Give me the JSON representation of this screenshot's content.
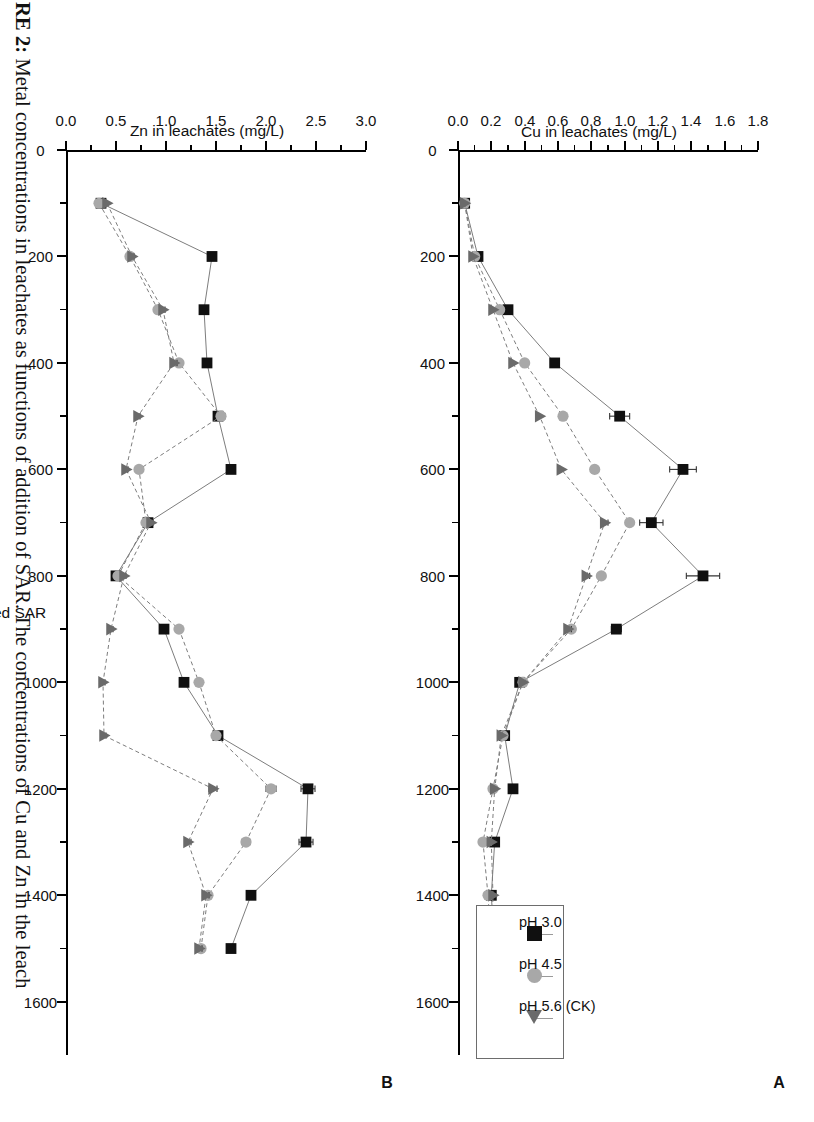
{
  "caption": {
    "prefix": "RE 2:",
    "text": " Metal concentrations in leachates as functions of addition of SAR. The concentrations of Cu and Zn in the leach"
  },
  "figure": {
    "xlabel": "mm of added SAR",
    "panel_a_letter": "A",
    "panel_b_letter": "B"
  },
  "legend": {
    "items": [
      {
        "label": "pH 3.0",
        "marker": "square-marker",
        "color": "#101010"
      },
      {
        "label": "pH 4.5",
        "marker": "circle-marker",
        "color": "#a8a8a8"
      },
      {
        "label": "pH 5.6 (CK)",
        "marker": "triangle-marker",
        "color": "#6a6a6a"
      }
    ]
  },
  "chart_data": [
    {
      "type": "line",
      "panel": "A",
      "title": "",
      "ylabel": "Cu in leachates (mg/L)",
      "xlabel": "mm of added SAR",
      "xlim": [
        0,
        1700
      ],
      "ylim": [
        0.0,
        1.8
      ],
      "xticks": [
        0,
        200,
        400,
        600,
        800,
        1000,
        1200,
        1400,
        1600
      ],
      "yticks": [
        "0.0",
        "0.2",
        "0.4",
        "0.6",
        "0.8",
        "1.0",
        "1.2",
        "1.4",
        "1.6",
        "1.8"
      ],
      "ytick_values": [
        0.0,
        0.2,
        0.4,
        0.6,
        0.8,
        1.0,
        1.2,
        1.4,
        1.6,
        1.8
      ],
      "grid": false,
      "legend_position": "bottom-right",
      "x": [
        100,
        200,
        300,
        400,
        500,
        600,
        700,
        800,
        900,
        1000,
        1100,
        1200,
        1300,
        1400,
        1500
      ],
      "series": [
        {
          "name": "pH 3.0",
          "marker": "square-marker",
          "color": "#101010",
          "values": [
            0.04,
            0.12,
            0.3,
            0.58,
            0.97,
            1.35,
            1.16,
            1.47,
            0.95,
            0.37,
            0.28,
            0.33,
            0.22,
            0.2,
            0.22
          ],
          "errors": [
            0.0,
            0.01,
            0.01,
            0.02,
            0.06,
            0.08,
            0.07,
            0.1,
            0.03,
            0.02,
            0.02,
            0.02,
            0.02,
            0.01,
            0.01
          ]
        },
        {
          "name": "pH 4.5",
          "marker": "circle-marker",
          "color": "#a8a8a8",
          "values": [
            0.04,
            0.1,
            0.25,
            0.4,
            0.63,
            0.82,
            1.03,
            0.86,
            0.68,
            0.39,
            0.27,
            0.21,
            0.15,
            0.18,
            0.2
          ],
          "errors": [
            0.0,
            0.01,
            0.01,
            0.01,
            0.02,
            0.02,
            0.02,
            0.02,
            0.02,
            0.02,
            0.01,
            0.01,
            0.01,
            0.01,
            0.01
          ]
        },
        {
          "name": "pH 5.6 (CK)",
          "marker": "triangle-marker",
          "color": "#6a6a6a",
          "values": [
            0.04,
            0.09,
            0.21,
            0.33,
            0.49,
            0.62,
            0.88,
            0.77,
            0.66,
            0.39,
            0.26,
            0.22,
            0.2,
            0.21,
            0.2
          ],
          "errors": [
            0.0,
            0.01,
            0.01,
            0.01,
            0.01,
            0.01,
            0.02,
            0.02,
            0.02,
            0.01,
            0.01,
            0.01,
            0.01,
            0.01,
            0.01
          ]
        }
      ]
    },
    {
      "type": "line",
      "panel": "B",
      "title": "",
      "ylabel": "Zn in leachates (mg/L)",
      "xlabel": "mm of added SAR",
      "xlim": [
        0,
        1700
      ],
      "ylim": [
        0.0,
        3.0
      ],
      "xticks": [
        0,
        200,
        400,
        600,
        800,
        1000,
        1200,
        1400,
        1600
      ],
      "yticks": [
        "0.0",
        "0.5",
        "1.0",
        "1.5",
        "2.0",
        "2.5",
        "3.0"
      ],
      "ytick_values": [
        0.0,
        0.5,
        1.0,
        1.5,
        2.0,
        2.5,
        3.0
      ],
      "grid": false,
      "legend_position": "none",
      "x": [
        100,
        200,
        300,
        400,
        500,
        600,
        700,
        800,
        900,
        1000,
        1100,
        1200,
        1300,
        1400,
        1500
      ],
      "series": [
        {
          "name": "pH 3.0",
          "marker": "square-marker",
          "color": "#101010",
          "values": [
            0.35,
            1.46,
            1.38,
            1.41,
            1.52,
            1.65,
            0.82,
            0.5,
            0.98,
            1.18,
            1.52,
            2.42,
            2.4,
            1.85,
            1.65
          ],
          "errors": [
            0.01,
            0.03,
            0.03,
            0.03,
            0.04,
            0.04,
            0.02,
            0.02,
            0.03,
            0.03,
            0.04,
            0.07,
            0.07,
            0.04,
            0.03
          ]
        },
        {
          "name": "pH 4.5",
          "marker": "circle-marker",
          "color": "#a8a8a8",
          "values": [
            0.33,
            0.64,
            0.92,
            1.13,
            1.55,
            0.73,
            0.8,
            0.52,
            1.13,
            1.33,
            1.5,
            2.05,
            1.8,
            1.42,
            1.35
          ],
          "errors": [
            0.01,
            0.02,
            0.02,
            0.03,
            0.04,
            0.02,
            0.02,
            0.02,
            0.03,
            0.03,
            0.03,
            0.05,
            0.04,
            0.03,
            0.03
          ]
        },
        {
          "name": "pH 5.6 (CK)",
          "marker": "triangle-marker",
          "color": "#6a6a6a",
          "values": [
            0.41,
            0.66,
            0.97,
            1.08,
            0.72,
            0.6,
            0.85,
            0.58,
            0.45,
            0.37,
            0.38,
            1.47,
            1.22,
            1.4,
            1.33
          ],
          "errors": [
            0.01,
            0.02,
            0.02,
            0.03,
            0.02,
            0.02,
            0.02,
            0.02,
            0.02,
            0.02,
            0.02,
            0.04,
            0.03,
            0.03,
            0.03
          ]
        }
      ]
    }
  ]
}
